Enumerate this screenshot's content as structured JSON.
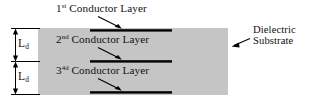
{
  "figure": {
    "name": "multilayer-conductor-dielectric-substrate-cross-section",
    "background_color": "#ffffff",
    "width": 315,
    "height": 103
  },
  "substrate": {
    "label_line1": "Dielectric",
    "label_line2": "Substrate",
    "fill_color": "#c5c5c5",
    "x": 38,
    "y": 28,
    "width": 190,
    "height": 67
  },
  "conductors": [
    {
      "label_prefix": "1",
      "label_superscript": "st",
      "label_suffix": " Conductor Layer",
      "color": "#000000",
      "y": 30
    },
    {
      "label_prefix": "2",
      "label_superscript": "nd",
      "label_suffix": " Conductor Layer",
      "color": "#000000",
      "y": 61
    },
    {
      "label_prefix": "3",
      "label_superscript": "4d",
      "label_suffix": " Conductor Layer",
      "color": "#000000",
      "y": 92
    }
  ],
  "dimensions": [
    {
      "symbol": "L",
      "subscript": "d"
    },
    {
      "symbol": "L",
      "subscript": "d"
    }
  ]
}
